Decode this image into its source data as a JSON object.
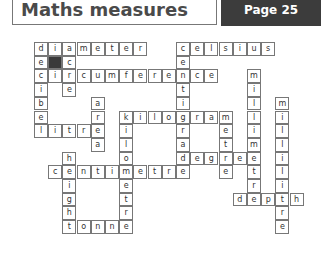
{
  "header": {
    "title": "Maths measures",
    "page": "Page 25"
  },
  "crossword": {
    "cell_w": 14.2,
    "cell_h": 13.7,
    "shaded": [
      [
        1,
        1
      ]
    ],
    "words": [
      {
        "word": "diameter",
        "row": 0,
        "col": 0,
        "dir": "across"
      },
      {
        "word": "celsius",
        "row": 0,
        "col": 10,
        "dir": "across"
      },
      {
        "word": "circumference",
        "row": 2,
        "col": 0,
        "dir": "across"
      },
      {
        "word": "kilogram",
        "row": 5,
        "col": 6,
        "dir": "across"
      },
      {
        "word": "litre",
        "row": 6,
        "col": 0,
        "dir": "across"
      },
      {
        "word": "degree",
        "row": 8,
        "col": 10,
        "dir": "across"
      },
      {
        "word": "centimetre",
        "row": 9,
        "col": 1,
        "dir": "across"
      },
      {
        "word": "depth",
        "row": 11,
        "col": 14,
        "dir": "across"
      },
      {
        "word": "tonne",
        "row": 13,
        "col": 2,
        "dir": "across"
      },
      {
        "word": "decibel",
        "row": 0,
        "col": 0,
        "dir": "down"
      },
      {
        "word": "acre",
        "row": 0,
        "col": 2,
        "dir": "down"
      },
      {
        "word": "centigrade",
        "row": 0,
        "col": 10,
        "dir": "down"
      },
      {
        "word": "millimetre",
        "row": 2,
        "col": 15,
        "dir": "down"
      },
      {
        "word": "area",
        "row": 4,
        "col": 4,
        "dir": "down"
      },
      {
        "word": "millilitre",
        "row": 4,
        "col": 17,
        "dir": "down"
      },
      {
        "word": "kilometre",
        "row": 5,
        "col": 6,
        "dir": "down"
      },
      {
        "word": "metre",
        "row": 5,
        "col": 13,
        "dir": "down"
      },
      {
        "word": "height",
        "row": 8,
        "col": 2,
        "dir": "down"
      }
    ]
  }
}
